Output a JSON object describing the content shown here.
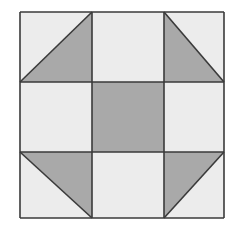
{
  "diagram": {
    "type": "quilt-block",
    "pattern": "3x3 grid with corner half-square triangles and dark center square",
    "colors": {
      "light": "#ececec",
      "dark": "#a9a9a9",
      "line": "#3a3a3a",
      "background": "#ffffff"
    },
    "grid": {
      "x": [
        20,
        92,
        164,
        224
      ],
      "y": [
        12,
        82,
        152,
        218
      ]
    },
    "cells": [
      {
        "row": 0,
        "col": 0,
        "fill": "light",
        "triangle": "bottom-right"
      },
      {
        "row": 0,
        "col": 1,
        "fill": "light"
      },
      {
        "row": 0,
        "col": 2,
        "fill": "light",
        "triangle": "bottom-left"
      },
      {
        "row": 1,
        "col": 0,
        "fill": "light"
      },
      {
        "row": 1,
        "col": 1,
        "fill": "dark"
      },
      {
        "row": 1,
        "col": 2,
        "fill": "light"
      },
      {
        "row": 2,
        "col": 0,
        "fill": "light",
        "triangle": "top-right"
      },
      {
        "row": 2,
        "col": 1,
        "fill": "light"
      },
      {
        "row": 2,
        "col": 2,
        "fill": "light",
        "triangle": "top-left"
      }
    ]
  }
}
